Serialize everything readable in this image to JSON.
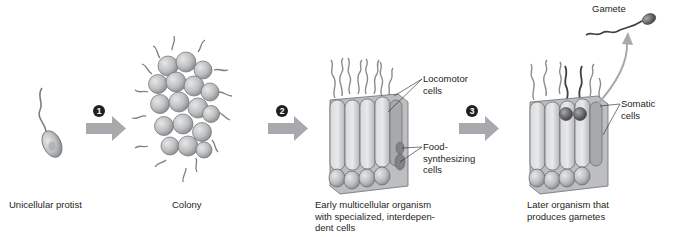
{
  "diagram": {
    "steps": [
      {
        "number": "1",
        "from": "Unicellular protist",
        "to": "Colony"
      },
      {
        "number": "2",
        "from": "Colony",
        "to": "Early multicellular organism"
      },
      {
        "number": "3",
        "from": "Early multicellular organism",
        "to": "Later organism"
      }
    ],
    "stages": [
      {
        "id": "protist",
        "caption": "Unicellular protist"
      },
      {
        "id": "colony",
        "caption": "Colony"
      },
      {
        "id": "early",
        "caption": "Early multicellular organism\nwith specialized, interdepen-\ndent cells"
      },
      {
        "id": "later",
        "caption": "Later organism that\nproduces gametes"
      }
    ],
    "callouts": {
      "locomotor": "Locomotor\ncells",
      "food": "Food-\nsynthesizing\ncells",
      "somatic": "Somatic\ncells",
      "gamete": "Gamete"
    },
    "colors": {
      "arrow": "#a7a9ac",
      "cell_fill": "#c8c9cb",
      "cell_stroke": "#6d6e71",
      "flagellum": "#7d7e80",
      "germ_cell": "#58595b",
      "text": "#231f20",
      "step_badge": "#231f20"
    }
  }
}
